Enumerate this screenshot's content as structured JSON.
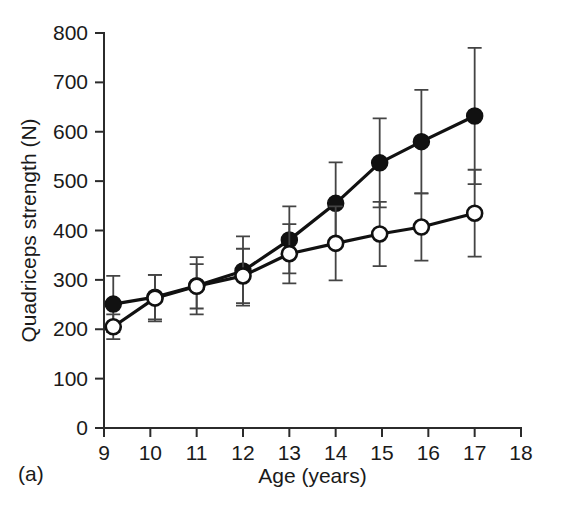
{
  "figure": {
    "panel_label": "(a)",
    "background_color": "#ffffff",
    "ink_color": "#111111"
  },
  "chart_data": {
    "type": "line",
    "title": "",
    "subtitle": "",
    "xlabel": "Age (years)",
    "ylabel": "Quadriceps strength (N)",
    "xlim": [
      9,
      18
    ],
    "ylim": [
      0,
      800
    ],
    "xticks": [
      9,
      10,
      11,
      12,
      13,
      14,
      15,
      16,
      17,
      18
    ],
    "yticks": [
      0,
      100,
      200,
      300,
      400,
      500,
      600,
      700,
      800
    ],
    "xtick_labels": [
      "9",
      "10",
      "11",
      "12",
      "13",
      "14",
      "15",
      "16",
      "17",
      "18"
    ],
    "ytick_labels": [
      "0",
      "100",
      "200",
      "300",
      "400",
      "500",
      "600",
      "700",
      "800"
    ],
    "grid": false,
    "legend": null,
    "legend_position": "none",
    "annotations": [
      "(a)"
    ],
    "error_bar_type": "symmetric",
    "series": [
      {
        "name": "closed-circles",
        "marker": "filled-circle",
        "x": [
          9.2,
          10.1,
          11.0,
          12.0,
          13.0,
          14.0,
          14.95,
          15.85,
          17.0
        ],
        "values": [
          251,
          265,
          288,
          318,
          381,
          455,
          537,
          580,
          632
        ],
        "errors": [
          57,
          45,
          58,
          70,
          68,
          83,
          90,
          105,
          138
        ]
      },
      {
        "name": "open-circles",
        "marker": "open-circle",
        "x": [
          9.2,
          10.1,
          11.0,
          12.0,
          13.0,
          14.0,
          14.95,
          15.85,
          17.0
        ],
        "values": [
          205,
          263,
          287,
          308,
          353,
          374,
          393,
          407,
          435
        ],
        "errors": [
          25,
          47,
          45,
          55,
          60,
          75,
          65,
          68,
          88
        ]
      }
    ]
  }
}
